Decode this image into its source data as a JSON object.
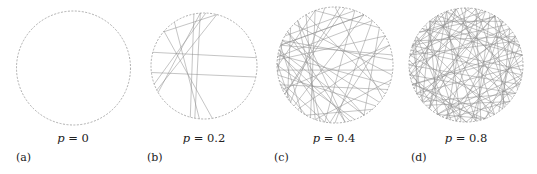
{
  "figure": {
    "ring_style": {
      "stroke": "#9a9a9a",
      "dash": "2 1.5"
    },
    "chord_color": "#8c8c8c",
    "panels": [
      {
        "id": "a",
        "sublabel": "(a)",
        "p_symbol": "p",
        "p_text": " = 0",
        "cx": 73.5,
        "cy": 68,
        "r": 57,
        "label_x": 73,
        "sublabel_x": 16,
        "chords": []
      },
      {
        "id": "b",
        "sublabel": "(b)",
        "p_symbol": "p",
        "p_text": " = 0.2",
        "cx": 204,
        "cy": 66,
        "r": 53,
        "label_x": 204,
        "sublabel_x": 147,
        "chords": [
          [
            195,
            351
          ],
          [
            173,
            12
          ],
          [
            259,
            105
          ],
          [
            266,
            100
          ],
          [
            221,
            81
          ],
          [
            220,
            284
          ],
          [
            150,
            266
          ],
          [
            153,
            284
          ],
          [
            236,
            95
          ],
          [
            160,
            272
          ]
        ]
      },
      {
        "id": "c",
        "sublabel": "(c)",
        "p_symbol": "p",
        "p_text": " = 0.4",
        "cx": 335,
        "cy": 65,
        "r": 58,
        "label_x": 334,
        "sublabel_x": 274,
        "chords": [
          [
            185,
            330
          ],
          [
            190,
            20
          ],
          [
            200,
            300
          ],
          [
            170,
            45
          ],
          [
            165,
            100
          ],
          [
            178,
            250
          ],
          [
            195,
            60
          ],
          [
            205,
            355
          ],
          [
            160,
            120
          ],
          [
            150,
            275
          ],
          [
            210,
            290
          ],
          [
            215,
            80
          ],
          [
            225,
            10
          ],
          [
            240,
            110
          ],
          [
            250,
            320
          ],
          [
            260,
            140
          ],
          [
            270,
            35
          ],
          [
            280,
            150
          ],
          [
            290,
            100
          ],
          [
            300,
            200
          ],
          [
            310,
            90
          ],
          [
            320,
            60
          ],
          [
            340,
            130
          ],
          [
            350,
            200
          ],
          [
            5,
            175
          ],
          [
            15,
            110
          ],
          [
            25,
            160
          ],
          [
            30,
            240
          ],
          [
            40,
            205
          ],
          [
            50,
            120
          ],
          [
            60,
            215
          ],
          [
            70,
            180
          ],
          [
            80,
            230
          ],
          [
            95,
            195
          ],
          [
            105,
            230
          ],
          [
            115,
            250
          ],
          [
            125,
            200
          ],
          [
            135,
            300
          ],
          [
            145,
            220
          ],
          [
            155,
            340
          ],
          [
            172,
            205
          ],
          [
            188,
            310
          ],
          [
            192,
            75
          ],
          [
            182,
            140
          ],
          [
            330,
            95
          ]
        ]
      },
      {
        "id": "d",
        "sublabel": "(d)",
        "p_symbol": "p",
        "p_text": " = 0.8",
        "cx": 466,
        "cy": 65,
        "r": 57,
        "label_x": 466,
        "sublabel_x": 411,
        "chords": [
          [
            0,
            150
          ],
          [
            5,
            200
          ],
          [
            10,
            120
          ],
          [
            15,
            250
          ],
          [
            20,
            180
          ],
          [
            25,
            300
          ],
          [
            30,
            140
          ],
          [
            35,
            220
          ],
          [
            40,
            110
          ],
          [
            45,
            260
          ],
          [
            50,
            190
          ],
          [
            55,
            330
          ],
          [
            60,
            160
          ],
          [
            65,
            240
          ],
          [
            70,
            120
          ],
          [
            75,
            280
          ],
          [
            80,
            200
          ],
          [
            85,
            310
          ],
          [
            90,
            170
          ],
          [
            95,
            250
          ],
          [
            100,
            350
          ],
          [
            105,
            210
          ],
          [
            110,
            290
          ],
          [
            115,
            20
          ],
          [
            120,
            230
          ],
          [
            125,
            330
          ],
          [
            130,
            260
          ],
          [
            135,
            40
          ],
          [
            140,
            200
          ],
          [
            145,
            300
          ],
          [
            150,
            70
          ],
          [
            155,
            240
          ],
          [
            160,
            350
          ],
          [
            165,
            280
          ],
          [
            170,
            30
          ],
          [
            175,
            260
          ],
          [
            180,
            320
          ],
          [
            185,
            90
          ],
          [
            190,
            300
          ],
          [
            195,
            10
          ],
          [
            200,
            250
          ],
          [
            205,
            330
          ],
          [
            210,
            60
          ],
          [
            215,
            290
          ],
          [
            220,
            350
          ],
          [
            225,
            100
          ],
          [
            230,
            310
          ],
          [
            235,
            30
          ],
          [
            240,
            340
          ],
          [
            245,
            80
          ],
          [
            250,
            130
          ],
          [
            255,
            20
          ],
          [
            260,
            170
          ],
          [
            265,
            60
          ],
          [
            270,
            110
          ],
          [
            275,
            200
          ],
          [
            280,
            40
          ],
          [
            285,
            130
          ],
          [
            290,
            170
          ],
          [
            295,
            80
          ],
          [
            300,
            140
          ],
          [
            305,
            10
          ],
          [
            310,
            100
          ],
          [
            315,
            200
          ],
          [
            320,
            50
          ],
          [
            325,
            150
          ],
          [
            330,
            110
          ],
          [
            335,
            190
          ],
          [
            340,
            70
          ],
          [
            345,
            160
          ],
          [
            350,
            230
          ],
          [
            355,
            120
          ],
          [
            12,
            90
          ],
          [
            48,
            300
          ],
          [
            72,
            15
          ],
          [
            138,
            320
          ],
          [
            188,
            240
          ],
          [
            232,
            140
          ],
          [
            268,
            340
          ],
          [
            302,
            215
          ],
          [
            342,
            250
          ],
          [
            118,
            175
          ],
          [
            162,
            75
          ],
          [
            208,
            150
          ]
        ]
      }
    ]
  }
}
